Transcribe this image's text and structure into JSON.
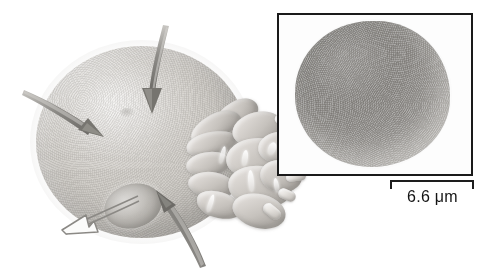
{
  "figure": {
    "kind": "scientific-illustration"
  },
  "illustration": {
    "cell_label": "",
    "parts": [
      {
        "name": "cell-body",
        "label": ""
      },
      {
        "name": "internal-vesicle",
        "label": ""
      },
      {
        "name": "membrane-ruffles",
        "label": ""
      },
      {
        "name": "microvilli-projections",
        "label": ""
      }
    ],
    "arrows": [
      {
        "name": "arrow-top-inward",
        "style": "filled",
        "color": "#7d7b77",
        "direction": "down",
        "label": ""
      },
      {
        "name": "arrow-left-inward",
        "style": "filled",
        "color": "#7d7b77",
        "direction": "down-right",
        "label": ""
      },
      {
        "name": "arrow-bottom-inward",
        "style": "filled",
        "color": "#6f6d69",
        "direction": "up-left",
        "label": ""
      },
      {
        "name": "arrow-lower-left-outward",
        "style": "outline",
        "color": "#8b8985",
        "direction": "down-left",
        "label": ""
      }
    ]
  },
  "inset": {
    "title": "",
    "caption": "",
    "border_color": "#1a1a1a",
    "scale_bar": {
      "label": "6.6 μm",
      "value": "6.6",
      "unit": "μm"
    }
  },
  "colors": {
    "background": "#ffffff",
    "ink": "#141414",
    "cell_mid": "#c6c2bd",
    "arrow_gray": "#7d7b77",
    "micrograph_gray": "#8e8c89"
  }
}
